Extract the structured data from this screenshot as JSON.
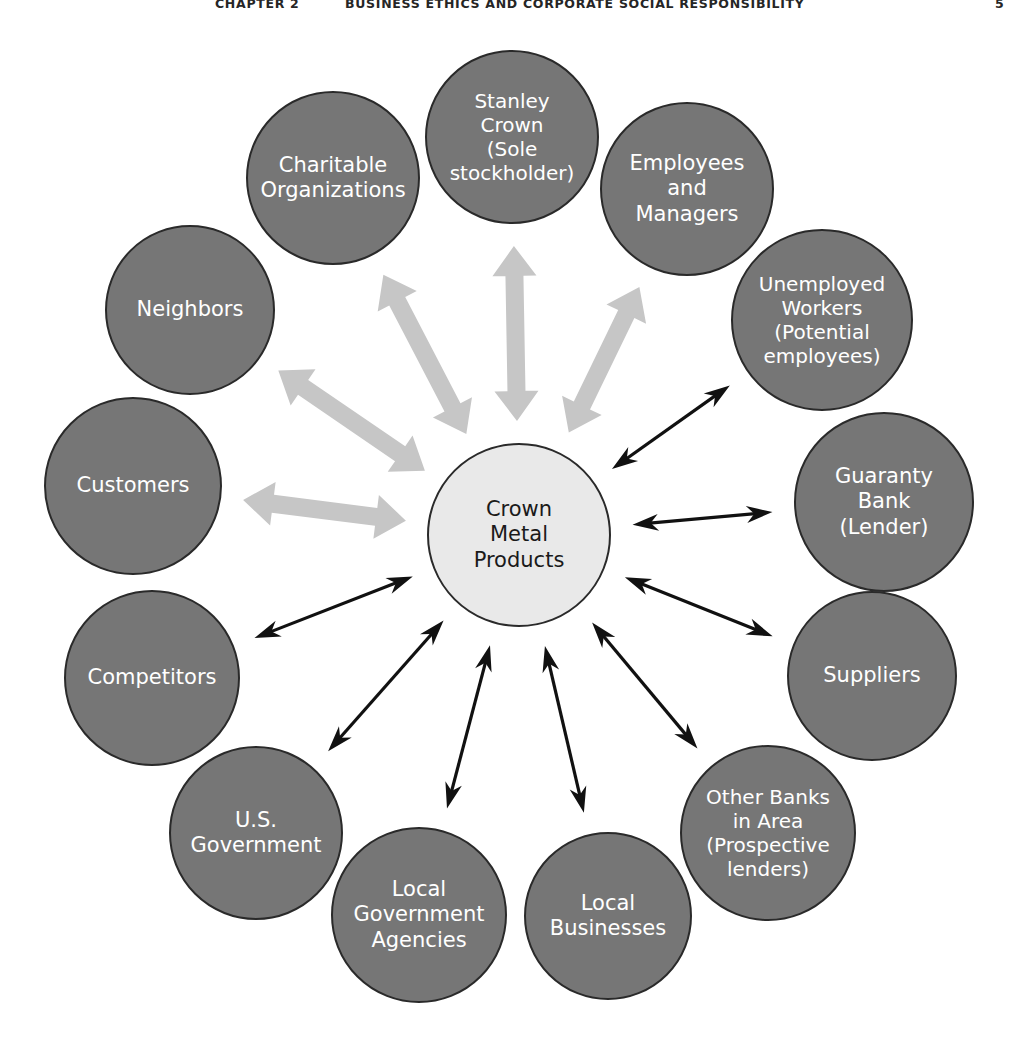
{
  "running_head": {
    "chapter": "CHAPTER 2",
    "title": "BUSINESS ETHICS AND CORPORATE SOCIAL RESPONSIBILITY",
    "page": "5"
  },
  "diagram": {
    "type": "hub-and-spoke stakeholder map",
    "center": {
      "label": "Crown\nMetal\nProducts",
      "fill": "#e9e9e9",
      "stroke": "#2a2a2a",
      "text_color": "#1a1a1a",
      "cx": 519,
      "cy": 535,
      "r": 92
    },
    "colors": {
      "outer_fill": "#767676",
      "outer_stroke": "#2a2a2a",
      "outer_text": "#ffffff",
      "thick_arrow": "#c6c6c6",
      "thin_arrow": "#111111",
      "page_background": "#ffffff"
    },
    "nodes": [
      {
        "id": "stanley-crown",
        "label": "Stanley\nCrown\n(Sole\nstockholder)",
        "cx": 512,
        "cy": 137,
        "r": 87,
        "arrow": "thick"
      },
      {
        "id": "charitable-organizations",
        "label": "Charitable\nOrganizations",
        "cx": 333,
        "cy": 178,
        "r": 87,
        "arrow": "thick"
      },
      {
        "id": "neighbors",
        "label": "Neighbors",
        "cx": 190,
        "cy": 310,
        "r": 85,
        "arrow": "thick"
      },
      {
        "id": "customers",
        "label": "Customers",
        "cx": 133,
        "cy": 486,
        "r": 89,
        "arrow": "thick"
      },
      {
        "id": "competitors",
        "label": "Competitors",
        "cx": 152,
        "cy": 678,
        "r": 88,
        "arrow": "thin"
      },
      {
        "id": "us-government",
        "label": "U.S.\nGovernment",
        "cx": 256,
        "cy": 833,
        "r": 87,
        "arrow": "thin"
      },
      {
        "id": "local-government-agencies",
        "label": "Local\nGovernment\nAgencies",
        "cx": 419,
        "cy": 915,
        "r": 88,
        "arrow": "thin"
      },
      {
        "id": "local-businesses",
        "label": "Local\nBusinesses",
        "cx": 608,
        "cy": 916,
        "r": 84,
        "arrow": "thin"
      },
      {
        "id": "other-banks-in-area",
        "label": "Other Banks\nin Area\n(Prospective\nlenders)",
        "cx": 768,
        "cy": 833,
        "r": 88,
        "arrow": "thin"
      },
      {
        "id": "suppliers",
        "label": "Suppliers",
        "cx": 872,
        "cy": 676,
        "r": 85,
        "arrow": "thin"
      },
      {
        "id": "guaranty-bank",
        "label": "Guaranty\nBank\n(Lender)",
        "cx": 884,
        "cy": 502,
        "r": 90,
        "arrow": "thin"
      },
      {
        "id": "unemployed-workers",
        "label": "Unemployed\nWorkers\n(Potential\nemployees)",
        "cx": 822,
        "cy": 320,
        "r": 91,
        "arrow": "thin"
      },
      {
        "id": "employees-and-managers",
        "label": "Employees\nand\nManagers",
        "cx": 687,
        "cy": 189,
        "r": 87,
        "arrow": "thick"
      }
    ],
    "connectors": [
      {
        "from": "center",
        "to": "stanley-crown",
        "style": "thick",
        "heads": "double"
      },
      {
        "from": "center",
        "to": "charitable-organizations",
        "style": "thick",
        "heads": "double"
      },
      {
        "from": "center",
        "to": "neighbors",
        "style": "thick",
        "heads": "double"
      },
      {
        "from": "center",
        "to": "customers",
        "style": "thick",
        "heads": "double"
      },
      {
        "from": "center",
        "to": "employees-and-managers",
        "style": "thick",
        "heads": "double"
      },
      {
        "from": "center",
        "to": "competitors",
        "style": "thin",
        "heads": "double"
      },
      {
        "from": "center",
        "to": "us-government",
        "style": "thin",
        "heads": "double"
      },
      {
        "from": "center",
        "to": "local-government-agencies",
        "style": "thin",
        "heads": "double"
      },
      {
        "from": "center",
        "to": "local-businesses",
        "style": "thin",
        "heads": "double"
      },
      {
        "from": "center",
        "to": "other-banks-in-area",
        "style": "thin",
        "heads": "double"
      },
      {
        "from": "center",
        "to": "suppliers",
        "style": "thin",
        "heads": "double"
      },
      {
        "from": "center",
        "to": "guaranty-bank",
        "style": "thin",
        "heads": "double"
      },
      {
        "from": "center",
        "to": "unemployed-workers",
        "style": "thin",
        "heads": "double"
      }
    ]
  }
}
